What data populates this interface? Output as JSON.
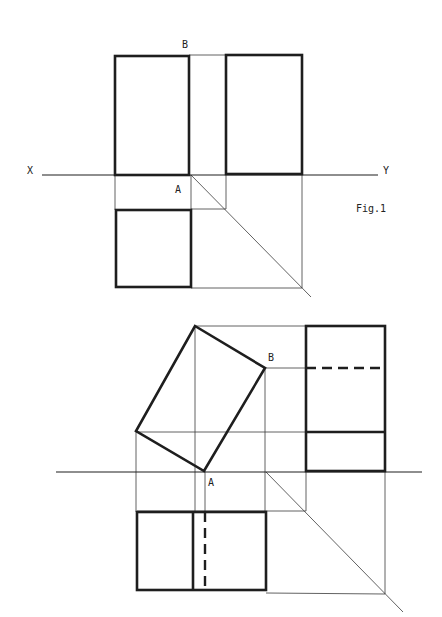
{
  "labels": {
    "fig1_x": "X",
    "fig1_y": "Y",
    "fig1_a": "A",
    "fig1_b": "B",
    "fig1_caption": "Fig.1",
    "fig2_a": "A",
    "fig2_b": "B"
  },
  "colors": {
    "line": "#1e1e1e",
    "construction": "#3a3a3a",
    "background": "#ffffff"
  },
  "fig1": {
    "xy_line": {
      "x1": 42,
      "y1": 175,
      "x2": 378,
      "y2": 175
    },
    "front_view": {
      "x": 115,
      "y": 56,
      "w": 74,
      "h": 119
    },
    "side_view": {
      "x": 226,
      "y": 55,
      "w": 76,
      "h": 119
    },
    "plan_view": {
      "x": 116,
      "y": 210,
      "w": 75,
      "h": 77
    },
    "miter_line": {
      "x1": 191,
      "y1": 175,
      "x2": 311,
      "y2": 297
    }
  },
  "fig2": {
    "xy_line": {
      "x1": 56,
      "y1": 472,
      "x2": 422,
      "y2": 472
    },
    "tilted_front_view": {
      "points": "195,326 265,368 204,471 136,431"
    },
    "side_view": {
      "x": 306,
      "y": 326,
      "w": 79,
      "h": 145,
      "hidden_line_y": 368,
      "edge_line_y": 432
    },
    "plan_view": {
      "x": 137,
      "y": 512,
      "w": 129,
      "h": 78,
      "edge_line_x": 193,
      "hidden_line_x": 205
    },
    "miter_line": {
      "x1": 266,
      "y1": 472,
      "x2": 403,
      "y2": 612
    }
  }
}
